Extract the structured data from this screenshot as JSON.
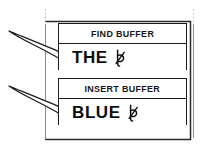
{
  "figure": {
    "background_color": "#ffffff",
    "ink_color": "#1b1b1b",
    "width": 209,
    "height": 148
  },
  "frame": {
    "name": "outer-frame",
    "guide_left_label": "left-margin-guide",
    "guide_right_label": "right-margin-guide"
  },
  "panels": [
    {
      "id": "find-buffer",
      "label": "FIND BUFFER",
      "value": "THE",
      "cursor": "text-cursor-glyph",
      "arrow": "callout-arrow"
    },
    {
      "id": "insert-buffer",
      "label": "INSERT BUFFER",
      "value": "BLUE",
      "cursor": "text-cursor-glyph",
      "arrow": "callout-arrow"
    }
  ],
  "arrows": [
    {
      "id": "arrow-to-find-value",
      "points_to": "find-buffer-value"
    },
    {
      "id": "arrow-to-insert-value",
      "points_to": "insert-buffer-value"
    }
  ]
}
